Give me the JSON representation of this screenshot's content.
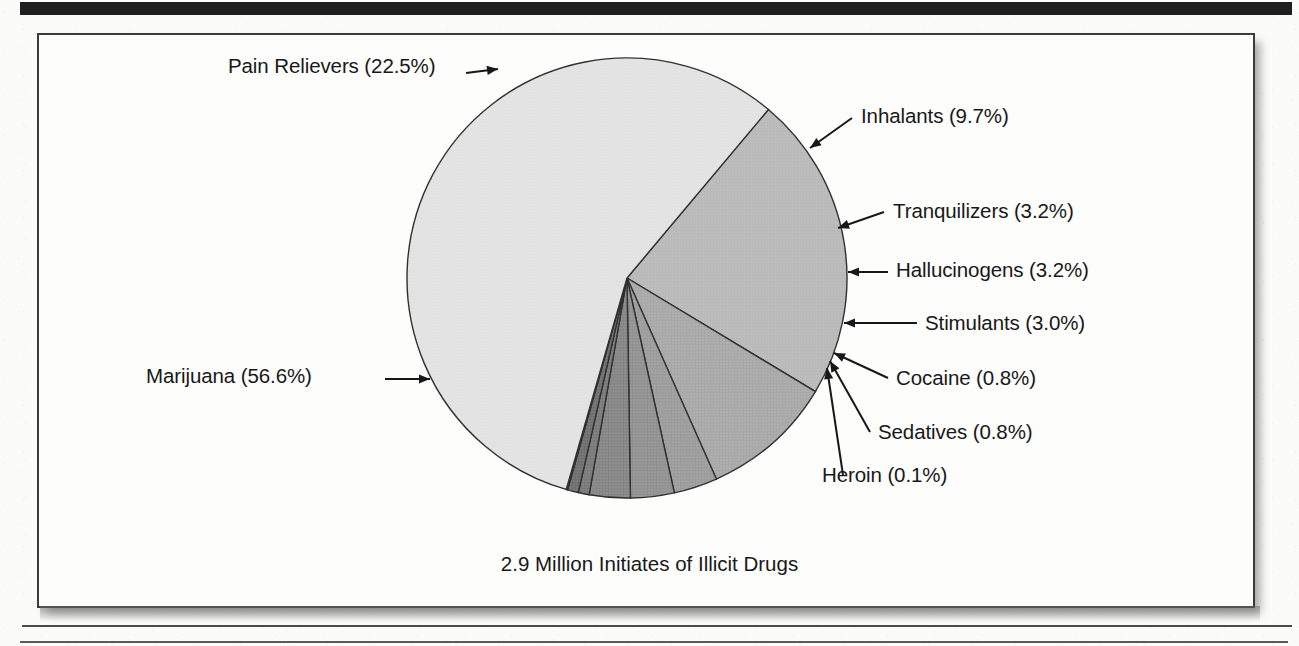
{
  "document": {
    "top_rule_color": "#201f1f",
    "frame_border_color": "#3a3a3a",
    "page_background": "#fbfbfa"
  },
  "chart_data": {
    "type": "pie",
    "title": "",
    "caption": "2.9 Million Initiates of Illicit Drugs",
    "total_label": "2.9 Million",
    "units": "percent",
    "start_angle_deg": -50,
    "direction": "clockwise",
    "legend": "none (direct labels with leader lines)",
    "categories": [
      "Marijuana",
      "Pain Relievers",
      "Inhalants",
      "Tranquilizers",
      "Hallucinogens",
      "Stimulants",
      "Cocaine",
      "Sedatives",
      "Heroin"
    ],
    "values": [
      56.6,
      22.5,
      9.7,
      3.2,
      3.2,
      3.0,
      0.8,
      0.8,
      0.1
    ],
    "slices": [
      {
        "name": "Pain Relievers",
        "value": 22.5,
        "label": "Pain Relievers (22.5%)",
        "color": "#b9b9b9"
      },
      {
        "name": "Inhalants",
        "value": 9.7,
        "label": "Inhalants (9.7%)",
        "color": "#a8a8a8"
      },
      {
        "name": "Tranquilizers",
        "value": 3.2,
        "label": "Tranquilizers (3.2%)",
        "color": "#9c9c9c"
      },
      {
        "name": "Hallucinogens",
        "value": 3.2,
        "label": "Hallucinogens (3.2%)",
        "color": "#919191"
      },
      {
        "name": "Stimulants",
        "value": 3.0,
        "label": "Stimulants (3.0%)",
        "color": "#858585"
      },
      {
        "name": "Cocaine",
        "value": 0.8,
        "label": "Cocaine (0.8%)",
        "color": "#7a7a7a"
      },
      {
        "name": "Sedatives",
        "value": 0.8,
        "label": "Sedatives (0.8%)",
        "color": "#6f6f6f"
      },
      {
        "name": "Heroin",
        "value": 0.1,
        "label": "Heroin (0.1%)",
        "color": "#5e5e5e"
      },
      {
        "name": "Marijuana",
        "value": 56.6,
        "label": "Marijuana (56.6%)",
        "color": "#e2e2e2"
      }
    ],
    "labels": {
      "pain_relievers": "Pain Relievers (22.5%)",
      "inhalants": "Inhalants (9.7%)",
      "tranquilizers": "Tranquilizers (3.2%)",
      "hallucinogens": "Hallucinogens (3.2%)",
      "stimulants": "Stimulants (3.0%)",
      "cocaine": "Cocaine (0.8%)",
      "sedatives": "Sedatives (0.8%)",
      "heroin": "Heroin (0.1%)",
      "marijuana": "Marijuana (56.6%)"
    }
  }
}
